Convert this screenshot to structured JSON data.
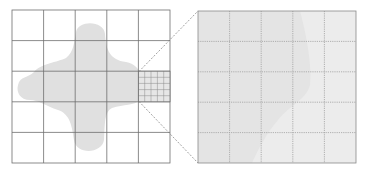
{
  "diagram": {
    "title": "",
    "left_grid": {
      "x": 12,
      "y": 10,
      "size": 158,
      "rows": 5,
      "cols": 5
    },
    "refined_cell": {
      "x": 138,
      "y": 71,
      "w": 32,
      "h": 31,
      "subdivisions": 5
    },
    "right_grid": {
      "x": 198,
      "y": 11,
      "size": 158,
      "rows": 5,
      "cols": 5
    },
    "colors": {
      "grid_line": "#6e6e6e",
      "fill": "#e0e0e0",
      "fill_light": "#ececec",
      "dashed": "#7a7a7a"
    }
  }
}
